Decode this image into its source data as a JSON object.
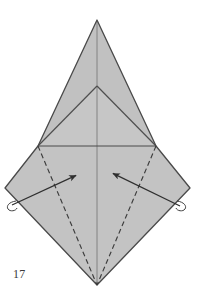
{
  "figure": {
    "kind": "origami-folding-diagram",
    "step_number": "17",
    "title": "",
    "caption": ""
  },
  "colors": {
    "paper_fill": "#c3c3c3",
    "paper_fill_upper": "#c0c0c0",
    "outline": "#4a4a4a",
    "crease_line": "#5a5a5a",
    "dashed_fold": "#3c3c3c",
    "arrow": "#333333",
    "background": "#ffffff",
    "step_text": "#3a3a3a"
  },
  "geometry": {
    "canvas": {
      "width": 197,
      "height": 298
    },
    "points": {
      "apex_top": [
        97,
        20
      ],
      "inner_apex": [
        97,
        86
      ],
      "left_shoulder": [
        38,
        146
      ],
      "right_shoulder": [
        156,
        146
      ],
      "left_far": [
        5,
        188
      ],
      "right_far": [
        190,
        188
      ],
      "bottom_point": [
        97,
        285
      ]
    },
    "outline_path": "M97,20 L156,146 L190,188 L97,285 L5,188 L38,146 Z",
    "upper_triangle_path": "M97,20 L156,146 L38,146 Z",
    "inner_triangle_path": "M97,86 L156,146 L38,146 Z",
    "lower_diamond_path": "M38,146 L156,146 L190,188 L97,285 L5,188 Z"
  },
  "creases": {
    "solid": [
      {
        "name": "horizontal-fold",
        "from": [
          38,
          146
        ],
        "to": [
          156,
          146
        ]
      },
      {
        "name": "inner-left-edge",
        "from": [
          97,
          86
        ],
        "to": [
          38,
          146
        ]
      },
      {
        "name": "inner-right-edge",
        "from": [
          97,
          86
        ],
        "to": [
          156,
          146
        ]
      },
      {
        "name": "vertical-centerline",
        "from": [
          97,
          20
        ],
        "to": [
          97,
          285
        ]
      }
    ],
    "dashed": [
      {
        "name": "valley-fold-left",
        "from": [
          38,
          146
        ],
        "to": [
          97,
          285
        ]
      },
      {
        "name": "valley-fold-right",
        "from": [
          156,
          146
        ],
        "to": [
          97,
          285
        ]
      }
    ]
  },
  "arrows": [
    {
      "name": "fold-arrow-left",
      "direction": "up-right",
      "tail": [
        12,
        205
      ],
      "tip": [
        79,
        174
      ]
    },
    {
      "name": "fold-arrow-right",
      "direction": "up-left",
      "tail": [
        180,
        206
      ],
      "tip": [
        110,
        172
      ]
    }
  ],
  "markers": [
    {
      "name": "hidden-flap-marker-left",
      "center": [
        12,
        206
      ]
    },
    {
      "name": "hidden-flap-marker-right",
      "center": [
        181,
        206
      ]
    }
  ]
}
